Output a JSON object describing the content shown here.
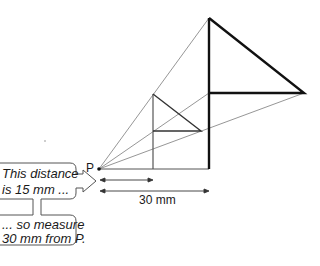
{
  "diagram": {
    "point_label": "P",
    "dimension_label": "30 mm",
    "callout_top": {
      "line1": "This distance",
      "line2": "is 15 mm ..."
    },
    "callout_bottom": {
      "line1": "... so measure",
      "line2": "30 mm from P."
    },
    "colors": {
      "thick_line": "#111111",
      "thin_line": "#888888",
      "callout_border": "#555555",
      "text": "#1a1a1a"
    }
  }
}
